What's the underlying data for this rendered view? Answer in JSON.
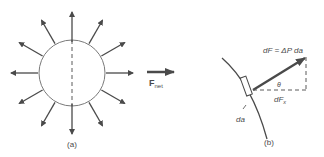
{
  "figure": {
    "panel_a": {
      "label": "(a)",
      "arrow_count": 12,
      "circle": {
        "cx": 72,
        "cy": 73,
        "r": 33
      }
    },
    "net_force": {
      "symbol": "F",
      "subscript": "net"
    },
    "panel_b": {
      "label": "(b)",
      "force_equation": "dF = ΔP da",
      "angle_label": "θ",
      "component_label": "dF",
      "component_subscript": "x",
      "area_label": "da"
    },
    "colors": {
      "stroke": "#5a5a5a",
      "arrow": "#4a4a4a",
      "text": "#4a4a4a"
    }
  }
}
